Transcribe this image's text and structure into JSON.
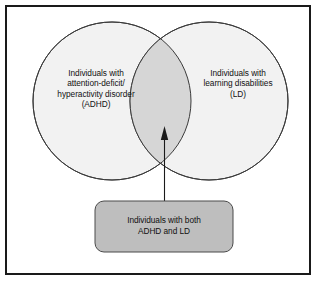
{
  "figure": {
    "type": "venn-diagram",
    "title": "",
    "frame": {
      "border_color": "#1a1a1a"
    }
  },
  "venn": {
    "left_circle": {
      "label": "Individuals with\nattention-deficit/\nhyperactivity disorder\n(ADHD)",
      "fill": "#f2f2f2",
      "stroke": "#3a3a3a"
    },
    "right_circle": {
      "label": "Individuals with\nlearning disabilities\n(LD)",
      "fill": "#f2f2f2",
      "stroke": "#3a3a3a"
    },
    "intersection": {
      "label": "",
      "fill": "#d6d6d6",
      "stroke": "#3a3a3a"
    }
  },
  "callout": {
    "label": "Individuals with both\nADHD and LD",
    "fill": "#bebebe",
    "stroke": "#4a4a4a"
  },
  "connector": {
    "type": "arrow",
    "color": "#1a1a1a",
    "points_to": "intersection"
  }
}
